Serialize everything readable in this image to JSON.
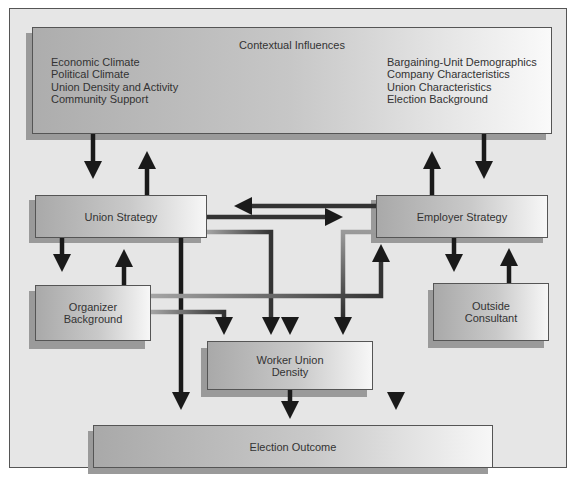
{
  "diagram": {
    "title": "Contextual Influences",
    "contextual_influences": {
      "title": "Contextual Influences",
      "left_items": [
        "Economic Climate",
        "Political Climate",
        "Union Density and Activity",
        "Community Support"
      ],
      "right_items": [
        "Bargaining-Unit Demographics",
        "Company Characteristics",
        "Union Characteristics",
        "Election Background"
      ]
    },
    "nodes": {
      "union_strategy": "Union Strategy",
      "employer_strategy": "Employer Strategy",
      "organizer_background": "Organizer Background",
      "outside_consultant": "Outside Consultant",
      "worker_union_density": "Worker Union Density",
      "election_outcome": "Election Outcome"
    },
    "node_lines": {
      "organizer_background": [
        "Organizer",
        "Background"
      ],
      "outside_consultant": [
        "Outside",
        "Consultant"
      ],
      "worker_union_density": [
        "Worker Union",
        "Density"
      ]
    },
    "edges": [
      {
        "from": "Contextual Influences",
        "to": "Union Strategy"
      },
      {
        "from": "Union Strategy",
        "to": "Contextual Influences"
      },
      {
        "from": "Contextual Influences",
        "to": "Employer Strategy"
      },
      {
        "from": "Employer Strategy",
        "to": "Contextual Influences"
      },
      {
        "from": "Contextual Influences",
        "to": "Worker Union Density"
      },
      {
        "from": "Union Strategy",
        "to": "Employer Strategy"
      },
      {
        "from": "Employer Strategy",
        "to": "Union Strategy"
      },
      {
        "from": "Union Strategy",
        "to": "Organizer Background"
      },
      {
        "from": "Organizer Background",
        "to": "Union Strategy"
      },
      {
        "from": "Employer Strategy",
        "to": "Outside Consultant"
      },
      {
        "from": "Outside Consultant",
        "to": "Employer Strategy"
      },
      {
        "from": "Union Strategy",
        "to": "Worker Union Density"
      },
      {
        "from": "Employer Strategy",
        "to": "Worker Union Density"
      },
      {
        "from": "Organizer Background",
        "to": "Worker Union Density"
      },
      {
        "from": "Organizer Background",
        "to": "Employer Strategy"
      },
      {
        "from": "Union Strategy",
        "to": "Election Outcome"
      },
      {
        "from": "Employer Strategy",
        "to": "Election Outcome"
      },
      {
        "from": "Worker Union Density",
        "to": "Election Outcome"
      }
    ],
    "colors": {
      "background": "#e6e6e6",
      "border": "#555555",
      "arrow_dark": "#1a1a1a",
      "arrow_gray": "#7a7a7a"
    }
  }
}
